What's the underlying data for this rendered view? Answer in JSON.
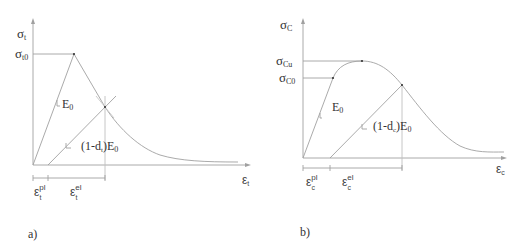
{
  "panels": [
    {
      "id": "a",
      "caption": "a)",
      "y_axis_label": {
        "main": "σ",
        "sub": "t"
      },
      "x_axis_label": {
        "main": "ε",
        "sub": "t"
      },
      "peak_label": {
        "main": "σ",
        "sub": "t0"
      },
      "slope_label": {
        "main": "E",
        "sub": "0"
      },
      "damaged_slope_label": {
        "pre": "(1-d",
        "sub": "t",
        "post": ")E",
        "sub2": "0"
      },
      "plastic_strain_label": {
        "main": "ε",
        "sup": "pl",
        "sub": "t"
      },
      "elastic_strain_label": {
        "main": "ε",
        "sup": "el",
        "sub": "t"
      }
    },
    {
      "id": "b",
      "caption": "b)",
      "y_axis_label": {
        "main": "σ",
        "sub": "C"
      },
      "x_axis_label": {
        "main": "ε",
        "sub": "c"
      },
      "ultimate_label": {
        "main": "σ",
        "sub": "Cu"
      },
      "initial_yield_label": {
        "main": "σ",
        "sub": "C0"
      },
      "slope_label": {
        "main": "E",
        "sub": "0"
      },
      "damaged_slope_label": {
        "pre": "(1-d",
        "sub": "c",
        "post": ")E",
        "sub2": "0"
      },
      "plastic_strain_label": {
        "main": "ε",
        "sup": "pl",
        "sub": "c"
      },
      "elastic_strain_label": {
        "main": "ε",
        "sup": "el",
        "sub": "c"
      }
    }
  ],
  "colors": {
    "line": "#9a9a9a",
    "text": "#333333"
  }
}
